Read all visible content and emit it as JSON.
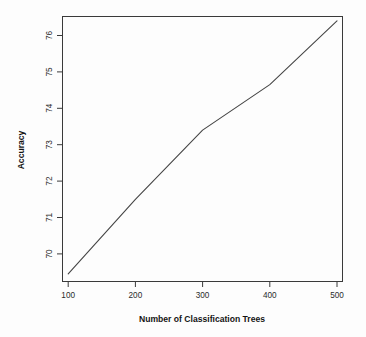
{
  "chart_data": {
    "type": "line",
    "title": "",
    "xlabel": "Number of Classification Trees",
    "ylabel": "Accuracy",
    "x": [
      100,
      200,
      300,
      400,
      500
    ],
    "values": [
      69.45,
      71.5,
      73.4,
      74.65,
      76.4
    ],
    "series": [
      {
        "name": "Accuracy",
        "values": [
          69.45,
          71.5,
          73.4,
          74.65,
          76.4
        ]
      }
    ],
    "xticks": [
      "100",
      "200",
      "300",
      "400",
      "500"
    ],
    "xtick_values": [
      100,
      200,
      300,
      400,
      500
    ],
    "yticks": [
      "70",
      "71",
      "72",
      "73",
      "74",
      "75",
      "76"
    ],
    "ytick_values": [
      70,
      71,
      72,
      73,
      74,
      75,
      76
    ],
    "xlim": [
      80,
      520
    ],
    "ylim": [
      69.0,
      76.6
    ],
    "grid": false,
    "legend": false,
    "legend_position": "none",
    "line_color": "#454545",
    "frame_color": "#3a3a3a",
    "background_color": "#fdfdfd"
  },
  "axes": {
    "y_title": "Accuracy",
    "x_title": "Number of Classification Trees",
    "x_tick_labels": [
      "100",
      "200",
      "300",
      "400",
      "500"
    ],
    "y_tick_labels": [
      "70",
      "71",
      "72",
      "73",
      "74",
      "75",
      "76"
    ]
  }
}
